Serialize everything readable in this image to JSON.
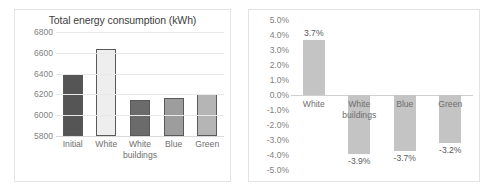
{
  "chart_data": [
    {
      "type": "bar",
      "title": "Total energy consumption (kWh)",
      "xlabel": "",
      "ylabel": "",
      "categories": [
        "Initial",
        "White",
        "White buildings",
        "Blue",
        "Green"
      ],
      "values": [
        6400,
        6635,
        6150,
        6165,
        6200
      ],
      "ylim": [
        5800,
        6800
      ],
      "yticks": [
        "5800",
        "6000",
        "6200",
        "6400",
        "6600",
        "6800"
      ],
      "ytick_values": [
        5800,
        6000,
        6200,
        6400,
        6600,
        6800
      ],
      "grid": true,
      "legend": "none",
      "bar_colors": [
        "#555555",
        "#eeeeee",
        "#6b6b6b",
        "#9d9d9d",
        "#b5b5b5"
      ],
      "bar_border": "#595959"
    },
    {
      "type": "bar",
      "title": "",
      "xlabel": "",
      "ylabel": "",
      "categories": [
        "White",
        "White buildings",
        "Blue",
        "Green"
      ],
      "values": [
        3.7,
        -3.9,
        -3.7,
        -3.2
      ],
      "data_labels": [
        "3.7%",
        "-3.9%",
        "-3.7%",
        "-3.2%"
      ],
      "ylim": [
        -5.0,
        5.0
      ],
      "yticks": [
        "5.0%",
        "4.0%",
        "3.0%",
        "2.0%",
        "1.0%",
        "0.0%",
        "-1.0%",
        "-2.0%",
        "-3.0%",
        "-4.0%",
        "-5.0%"
      ],
      "ytick_values": [
        5,
        4,
        3,
        2,
        1,
        0,
        -1,
        -2,
        -3,
        -4,
        -5
      ],
      "grid": false,
      "legend": "none",
      "bar_colors": [
        "#c4c4c4",
        "#c4c4c4",
        "#c4c4c4",
        "#c4c4c4"
      ],
      "zero_line_color": "#d0d0d0"
    }
  ],
  "left_chart": {
    "title": "Total energy consumption (kWh)",
    "yticks": [
      "6800",
      "6600",
      "6400",
      "6200",
      "6000",
      "5800"
    ],
    "categories": [
      {
        "line1": "Initial",
        "line2": ""
      },
      {
        "line1": "White",
        "line2": ""
      },
      {
        "line1": "White",
        "line2": "buildings"
      },
      {
        "line1": "Blue",
        "line2": ""
      },
      {
        "line1": "Green",
        "line2": ""
      }
    ]
  },
  "right_chart": {
    "yticks": [
      "5.0%",
      "4.0%",
      "3.0%",
      "2.0%",
      "1.0%",
      "0.0%",
      "-1.0%",
      "-2.0%",
      "-3.0%",
      "-4.0%",
      "-5.0%"
    ],
    "bars": [
      {
        "cat1": "White",
        "cat2": "",
        "label": "3.7%"
      },
      {
        "cat1": "White",
        "cat2": "buildings",
        "label": "-3.9%"
      },
      {
        "cat1": "Blue",
        "cat2": "",
        "label": "-3.7%"
      },
      {
        "cat1": "Green",
        "cat2": "",
        "label": "-3.2%"
      }
    ]
  }
}
